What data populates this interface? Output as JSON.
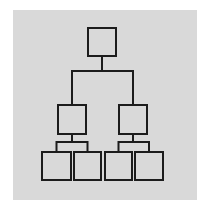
{
  "diagram": {
    "type": "hierarchy-tree",
    "panel_color": "#d9d9d9",
    "stroke_color": "#1c1c1c",
    "background_color": "#ffffff",
    "stroke_width": 2,
    "levels": 3,
    "nodes": [
      {
        "id": "root",
        "level": 0,
        "x": 88,
        "y": 28,
        "w": 28,
        "h": 28
      },
      {
        "id": "mid-left",
        "level": 1,
        "x": 58,
        "y": 105,
        "w": 28,
        "h": 29
      },
      {
        "id": "mid-right",
        "level": 1,
        "x": 119,
        "y": 105,
        "w": 28,
        "h": 29
      },
      {
        "id": "leaf-1",
        "level": 2,
        "x": 42,
        "y": 152,
        "w": 29,
        "h": 28
      },
      {
        "id": "leaf-2",
        "level": 2,
        "x": 74,
        "y": 152,
        "w": 27,
        "h": 28
      },
      {
        "id": "leaf-3",
        "level": 2,
        "x": 105,
        "y": 152,
        "w": 27,
        "h": 28
      },
      {
        "id": "leaf-4",
        "level": 2,
        "x": 135,
        "y": 152,
        "w": 28,
        "h": 28
      }
    ],
    "edges": [
      {
        "from": "root",
        "to": "mid-left"
      },
      {
        "from": "root",
        "to": "mid-right"
      },
      {
        "from": "mid-left",
        "to": "leaf-1"
      },
      {
        "from": "mid-left",
        "to": "leaf-2"
      },
      {
        "from": "mid-right",
        "to": "leaf-3"
      },
      {
        "from": "mid-right",
        "to": "leaf-4"
      }
    ]
  }
}
